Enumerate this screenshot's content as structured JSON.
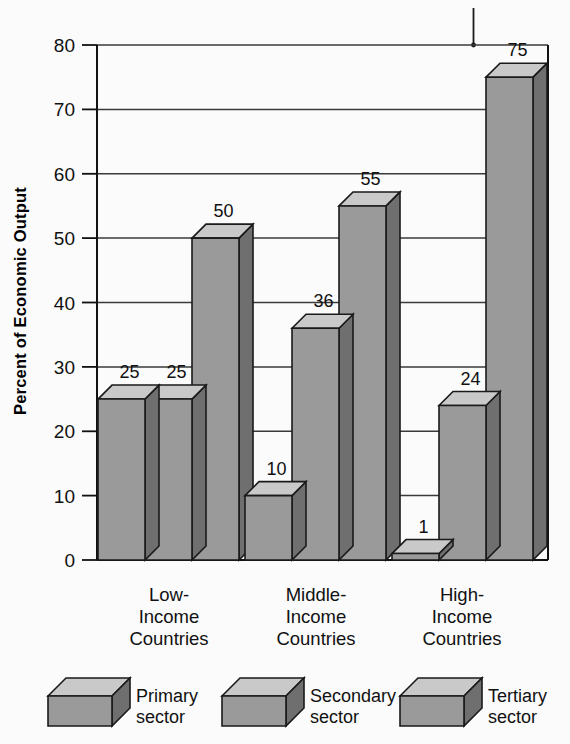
{
  "chart_data": {
    "type": "bar",
    "title": "",
    "xlabel": "",
    "ylabel": "Percent of Economic Output",
    "ylim": [
      0,
      80
    ],
    "yticks": [
      0,
      10,
      20,
      30,
      40,
      50,
      60,
      70,
      80
    ],
    "ytick_labels": [
      "0",
      "10",
      "20",
      "30",
      "40",
      "50",
      "60",
      "70",
      "80"
    ],
    "grid": true,
    "legend_position": "bottom",
    "categories": [
      "Low-\nIncome\nCountries",
      "Middle-\nIncome\nCountries",
      "High-\nIncome\nCountries"
    ],
    "category_lines": [
      [
        "Low-",
        "Income",
        "Countries"
      ],
      [
        "Middle-",
        "Income",
        "Countries"
      ],
      [
        "High-",
        "Income",
        "Countries"
      ]
    ],
    "series": [
      {
        "name": "Primary sector",
        "values": [
          25,
          10,
          1
        ]
      },
      {
        "name": "Secondary sector",
        "values": [
          25,
          36,
          24
        ]
      },
      {
        "name": "Tertiary sector",
        "values": [
          50,
          55,
          75
        ]
      }
    ],
    "data_labels": [
      [
        "25",
        "25",
        "50"
      ],
      [
        "10",
        "36",
        "55"
      ],
      [
        "1",
        "24",
        "75"
      ]
    ],
    "colors": {
      "bar_front": "#9a9a9a",
      "bar_top": "#c9c9c9",
      "bar_side": "#6f6f6f",
      "outline": "#1a1a1a",
      "background": "#fbfbfb",
      "gridline": "#3a3a3a",
      "axis": "#111111",
      "text": "#111111"
    }
  },
  "legend": {
    "items": [
      {
        "line1": "Primary",
        "line2": "sector",
        "icon": "cube-icon"
      },
      {
        "line1": "Secondary",
        "line2": "sector",
        "icon": "cube-icon"
      },
      {
        "line1": "Tertiary",
        "line2": "sector",
        "icon": "cube-icon"
      }
    ]
  },
  "axis": {
    "y_title": "Percent of Economic Output"
  },
  "annotations": {
    "leader_line": "vertical leader line from cropped caption above plot"
  }
}
